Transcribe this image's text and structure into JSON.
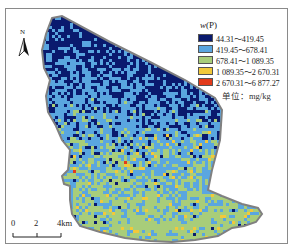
{
  "map": {
    "title_hidden": "",
    "north_arrow": {
      "label": "N",
      "icon": "north-arrow-icon"
    },
    "legend": {
      "title_var": "w",
      "title_arg": "(P)",
      "classes": [
        {
          "label": "44.31～419.45",
          "color": "#0a1a6e"
        },
        {
          "label": "419.45～678.41",
          "color": "#5aa6e0"
        },
        {
          "label": "678.41～1 089.35",
          "color": "#a8cd7a"
        },
        {
          "label": "1 089.35～2 670.31",
          "color": "#f2c93a"
        },
        {
          "label": "2 670.31～6 877.27",
          "color": "#e23a1a"
        }
      ],
      "unit": "单位：mg/kg"
    },
    "scale_bar": {
      "ticks": [
        "0",
        "2",
        "4km"
      ]
    },
    "boundary_color": "#808080"
  }
}
